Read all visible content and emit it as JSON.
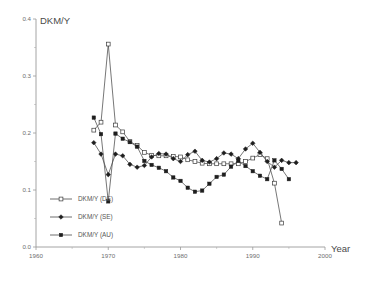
{
  "chart_data": {
    "type": "line",
    "title": "",
    "ylabel": "DKM/Y",
    "xlabel": "Year",
    "xlim": [
      1960,
      2000
    ],
    "ylim": [
      0.0,
      0.4
    ],
    "xticks": [
      1960,
      1970,
      1980,
      1990,
      2000
    ],
    "xtick_labels": [
      "1960",
      "1970",
      "1980",
      "1990",
      "2000"
    ],
    "xticks_minor": [
      1965,
      1975,
      1985,
      1995
    ],
    "yticks": [
      0.0,
      0.1,
      0.2,
      0.3,
      0.4
    ],
    "ytick_labels": [
      "0.0",
      "0.1",
      "0.2",
      "0.3",
      "0.4"
    ],
    "yticks_minor": [
      0.05,
      0.15,
      0.25,
      0.35
    ],
    "grid": false,
    "legend_position": "lower-left-inside",
    "series": [
      {
        "name": "DKM/Y (DE)",
        "marker": "open-square",
        "x": [
          1968,
          1969,
          1970,
          1971,
          1972,
          1973,
          1974,
          1975,
          1976,
          1977,
          1978,
          1979,
          1980,
          1981,
          1982,
          1983,
          1984,
          1985,
          1986,
          1987,
          1988,
          1989,
          1990,
          1991,
          1992,
          1993,
          1994
        ],
        "values": [
          0.205,
          0.219,
          0.356,
          0.214,
          0.202,
          0.185,
          0.178,
          0.166,
          0.161,
          0.16,
          0.16,
          0.159,
          0.158,
          0.153,
          0.15,
          0.147,
          0.146,
          0.146,
          0.146,
          0.146,
          0.146,
          0.15,
          0.156,
          0.162,
          0.155,
          0.112,
          0.042
        ]
      },
      {
        "name": "DKM/Y (SE)",
        "marker": "solid-diamond",
        "x": [
          1968,
          1969,
          1970,
          1971,
          1972,
          1973,
          1974,
          1975,
          1976,
          1977,
          1978,
          1979,
          1980,
          1981,
          1982,
          1983,
          1984,
          1985,
          1986,
          1987,
          1988,
          1989,
          1990,
          1991,
          1992,
          1993,
          1994,
          1995,
          1996
        ],
        "values": [
          0.183,
          0.163,
          0.127,
          0.163,
          0.16,
          0.145,
          0.14,
          0.143,
          0.158,
          0.164,
          0.163,
          0.155,
          0.15,
          0.162,
          0.168,
          0.152,
          0.149,
          0.155,
          0.165,
          0.163,
          0.155,
          0.172,
          0.182,
          0.166,
          0.15,
          0.14,
          0.152,
          0.148,
          0.148
        ]
      },
      {
        "name": "DKM/Y (AU)",
        "marker": "solid-square",
        "x": [
          1968,
          1969,
          1970,
          1971,
          1972,
          1973,
          1974,
          1975,
          1976,
          1977,
          1978,
          1979,
          1980,
          1981,
          1982,
          1983,
          1984,
          1985,
          1986,
          1987,
          1988,
          1989,
          1990,
          1991,
          1992,
          1993,
          1994,
          1995
        ],
        "values": [
          0.227,
          0.198,
          0.08,
          0.199,
          0.19,
          0.184,
          0.176,
          0.151,
          0.144,
          0.139,
          0.133,
          0.122,
          0.116,
          0.104,
          0.097,
          0.099,
          0.111,
          0.123,
          0.127,
          0.141,
          0.151,
          0.142,
          0.133,
          0.125,
          0.119,
          0.152,
          0.137,
          0.119
        ]
      }
    ]
  },
  "legend": {
    "items": [
      {
        "label": "DKM/Y (DE)",
        "marker": "open-square"
      },
      {
        "label": "DKM/Y (SE)",
        "marker": "solid-diamond"
      },
      {
        "label": "DKM/Y (AU)",
        "marker": "solid-square"
      }
    ]
  },
  "colors": {
    "axis": "#9a9a9a",
    "line": "#4a4a4a",
    "marker_fill": "#1e1e1e",
    "text": "#555555",
    "background": "#ffffff"
  }
}
